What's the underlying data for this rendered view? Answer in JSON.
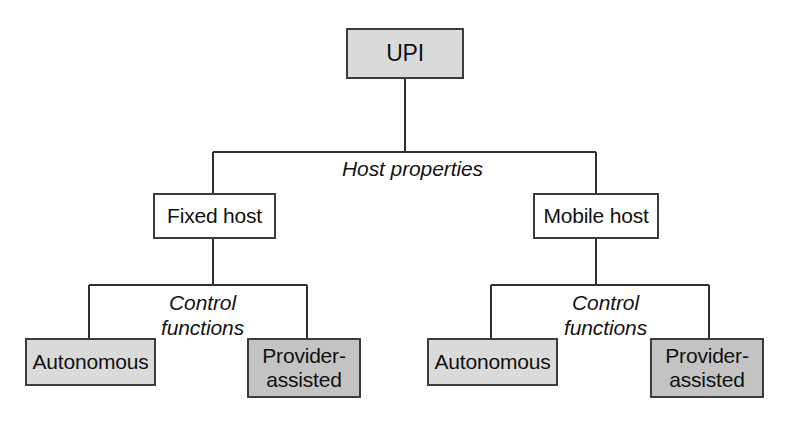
{
  "diagram": {
    "type": "tree",
    "colors": {
      "fill_light": "#dadada",
      "fill_mid": "#c3c3c3",
      "fill_white": "#ffffff",
      "border": "#3c3c3c",
      "line": "#2f2f2f",
      "text": "#111111",
      "background": "#ffffff"
    },
    "nodes": {
      "root": {
        "label": "UPI",
        "fill": "light",
        "level": 0
      },
      "mid_left": {
        "label": "Fixed host",
        "fill": "white",
        "level": 1
      },
      "mid_right": {
        "label": "Mobile host",
        "fill": "white",
        "level": 1
      },
      "leaf_left_autonomous": {
        "label": "Autonomous",
        "fill": "light",
        "level": 2
      },
      "leaf_left_provider": {
        "label": "Provider-\nassisted",
        "fill": "mid",
        "level": 2
      },
      "leaf_right_autonomous": {
        "label": "Autonomous",
        "fill": "light",
        "level": 2
      },
      "leaf_right_provider": {
        "label": "Provider-\nassisted",
        "fill": "mid",
        "level": 2
      }
    },
    "edge_labels": {
      "host_properties": "Host properties",
      "control_functions_left": "Control\nfunctions",
      "control_functions_right": "Control\nfunctions"
    }
  }
}
